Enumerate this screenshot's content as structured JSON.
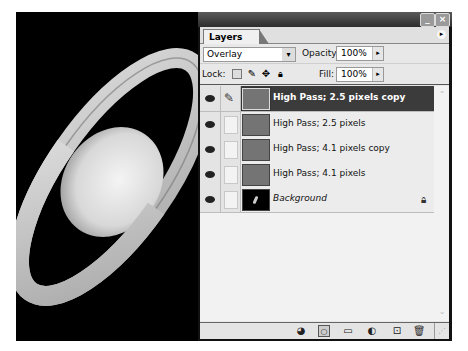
{
  "canvas": {
    "subject": "Saturn image",
    "background": "#000000"
  },
  "panel": {
    "title_buttons": {
      "minimize": "_",
      "close": "×"
    },
    "tab_label": "Layers",
    "flyout_menu_icon": "▸",
    "blend_mode": {
      "value": "Overlay",
      "arrow": "▾"
    },
    "opacity": {
      "label": "Opacity:",
      "value": "100%",
      "arrow": "▸"
    },
    "lock": {
      "label": "Lock:",
      "icons": [
        "transparent-pixels",
        "image-pixels",
        "position",
        "all"
      ]
    },
    "fill": {
      "label": "Fill:",
      "value": "100%",
      "arrow": "▸"
    },
    "layers": [
      {
        "name": "High Pass; 2.5 pixels copy",
        "visible": true,
        "selected": true,
        "brush": true,
        "thumb": "gray",
        "locked": false
      },
      {
        "name": "High Pass; 2.5 pixels",
        "visible": true,
        "selected": false,
        "brush": false,
        "thumb": "gray",
        "locked": false
      },
      {
        "name": "High Pass; 4.1 pixels copy",
        "visible": true,
        "selected": false,
        "brush": false,
        "thumb": "gray",
        "locked": false
      },
      {
        "name": "High Pass; 4.1 pixels",
        "visible": true,
        "selected": false,
        "brush": false,
        "thumb": "gray",
        "locked": false
      },
      {
        "name": "Background",
        "visible": true,
        "selected": false,
        "brush": false,
        "thumb": "black",
        "locked": true,
        "italic": true
      }
    ],
    "bottom_toolbar": [
      "layer-style",
      "add-mask",
      "new-group",
      "adjustment-layer",
      "new-layer",
      "delete-layer"
    ],
    "colors": {
      "selected_row": "#3b3b3b",
      "layer_thumb": "#747474"
    }
  }
}
